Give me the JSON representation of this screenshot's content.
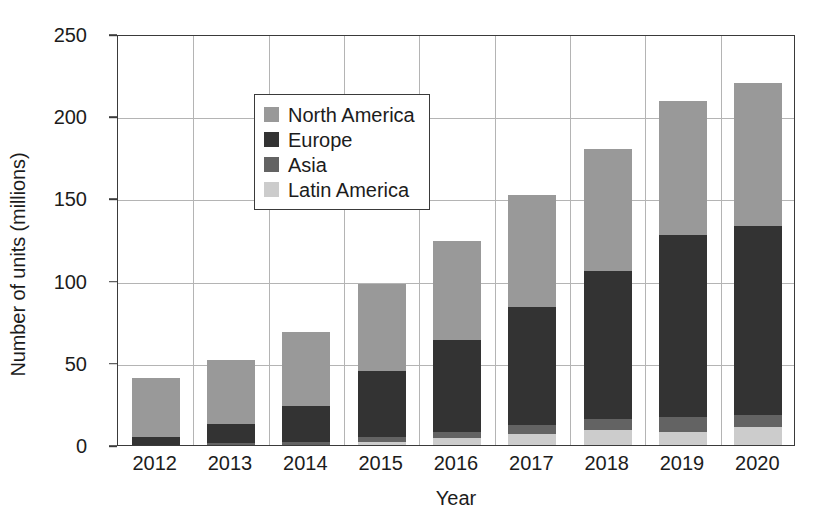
{
  "chart_data": {
    "type": "bar",
    "stacked": true,
    "title": "",
    "xlabel": "Year",
    "ylabel": "Number of units (millions)",
    "categories": [
      "2012",
      "2013",
      "2014",
      "2015",
      "2016",
      "2017",
      "2018",
      "2019",
      "2020"
    ],
    "ylim": [
      0,
      250
    ],
    "yticks": [
      0,
      50,
      100,
      150,
      200,
      250
    ],
    "grid": true,
    "legend_position": "upper left",
    "stack_order_bottom_to_top": [
      "Latin America",
      "Asia",
      "Europe",
      "North America"
    ],
    "series": [
      {
        "name": "North America",
        "color": "#999999",
        "values": [
          36,
          39,
          45,
          53,
          60,
          68,
          74,
          81,
          87
        ]
      },
      {
        "name": "Europe",
        "color": "#333333",
        "values": [
          5,
          12,
          22,
          40,
          56,
          72,
          90,
          111,
          115
        ]
      },
      {
        "name": "Asia",
        "color": "#636363",
        "values": [
          0,
          1,
          2,
          3,
          4,
          5,
          7,
          9,
          7
        ]
      },
      {
        "name": "Latin America",
        "color": "#cccccc",
        "values": [
          0,
          0,
          0,
          2,
          4,
          7,
          9,
          8,
          11
        ]
      }
    ],
    "totals": [
      41,
      52,
      69,
      98,
      124,
      152,
      180,
      209,
      220
    ]
  },
  "legend": {
    "items": [
      {
        "label": "North America",
        "color": "#999999"
      },
      {
        "label": "Europe",
        "color": "#333333"
      },
      {
        "label": "Asia",
        "color": "#636363"
      },
      {
        "label": "Latin America",
        "color": "#cccccc"
      }
    ]
  }
}
